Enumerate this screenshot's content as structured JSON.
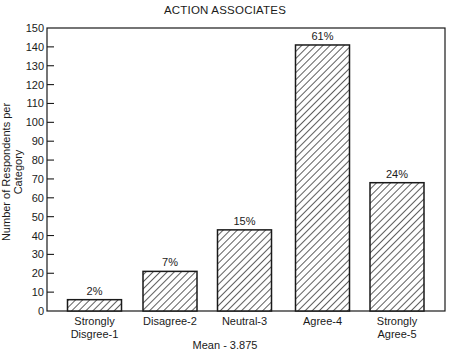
{
  "chart_data": {
    "type": "bar",
    "title": "ACTION ASSOCIATES",
    "xlabel": "Mean - 3.875",
    "ylabel": "Number of Respondents per Category",
    "ylim": [
      0,
      150
    ],
    "yticks": [
      0,
      10,
      20,
      30,
      40,
      50,
      60,
      70,
      80,
      90,
      100,
      110,
      120,
      130,
      140,
      150
    ],
    "grid": false,
    "legend": null,
    "bar_fill": "diagonal hatch",
    "categories": [
      [
        "Strongly",
        "Disgree-1"
      ],
      [
        "Disagree-2"
      ],
      [
        "Neutral-3"
      ],
      [
        "Agree-4"
      ],
      [
        "Strongly",
        "Agree-5"
      ]
    ],
    "values": [
      6,
      21,
      43,
      141,
      68
    ],
    "data_labels": [
      "2%",
      "7%",
      "15%",
      "61%",
      "24%"
    ]
  },
  "colors": {
    "ink": "#1a1a1a",
    "background": "#ffffff"
  }
}
